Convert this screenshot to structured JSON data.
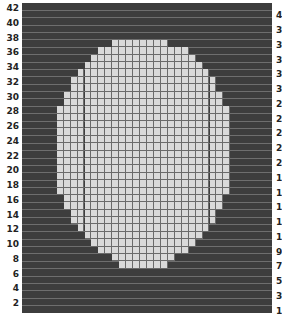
{
  "chart": {
    "cols": 36,
    "rows": 42,
    "colors": {
      "background": "#3d3d3d",
      "filled": "#d9d9d9",
      "gridline": "#6a6a6a"
    },
    "left_labels": [
      "42",
      "40",
      "38",
      "36",
      "34",
      "32",
      "30",
      "28",
      "26",
      "24",
      "22",
      "20",
      "18",
      "16",
      "14",
      "12",
      "10",
      "8",
      "6",
      "4",
      "2"
    ],
    "right_labels": [
      "4",
      "3",
      "3",
      "3",
      "3",
      "3",
      "2",
      "2",
      "2",
      "2",
      "2",
      "1",
      "1",
      "1",
      "1",
      "1",
      "9",
      "7",
      "5",
      "3",
      "1"
    ],
    "filled_rows": [
      [
        5,
        13,
        20
      ],
      [
        6,
        11,
        23
      ],
      [
        7,
        10,
        24
      ],
      [
        8,
        9,
        25
      ],
      [
        9,
        8,
        26
      ],
      [
        10,
        7,
        27
      ],
      [
        11,
        7,
        27
      ],
      [
        12,
        6,
        28
      ],
      [
        13,
        6,
        28
      ],
      [
        14,
        5,
        29
      ],
      [
        15,
        5,
        29
      ],
      [
        16,
        5,
        29
      ],
      [
        17,
        5,
        29
      ],
      [
        18,
        5,
        29
      ],
      [
        19,
        5,
        29
      ],
      [
        20,
        5,
        29
      ],
      [
        21,
        5,
        29
      ],
      [
        22,
        5,
        29
      ],
      [
        23,
        5,
        29
      ],
      [
        24,
        5,
        29
      ],
      [
        25,
        5,
        29
      ],
      [
        26,
        6,
        28
      ],
      [
        27,
        6,
        28
      ],
      [
        28,
        7,
        27
      ],
      [
        29,
        7,
        27
      ],
      [
        30,
        8,
        26
      ],
      [
        31,
        9,
        25
      ],
      [
        32,
        10,
        24
      ],
      [
        33,
        11,
        23
      ],
      [
        34,
        13,
        21
      ],
      [
        35,
        14,
        20
      ]
    ]
  }
}
